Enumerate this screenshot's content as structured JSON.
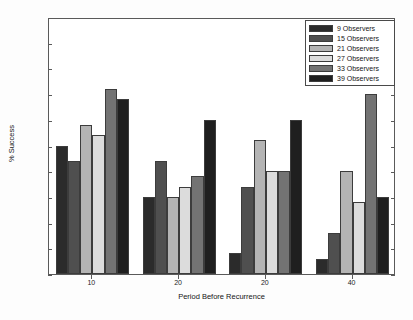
{
  "chart_data": {
    "type": "bar",
    "title": "",
    "xlabel": "Period Before Recurrence",
    "ylabel": "% Success",
    "categories": [
      "10",
      "20",
      "20",
      "40"
    ],
    "xtick_labels": [
      "10",
      "20",
      "20",
      "40"
    ],
    "ytick_labels": [
      "50",
      "55",
      "60",
      "65",
      "70",
      "75",
      "80",
      "85",
      "90",
      "95",
      "100"
    ],
    "ylim": [
      50,
      100
    ],
    "ystep": 5,
    "grid": false,
    "legend_position": "top-right",
    "series": [
      {
        "name": "9 Observers",
        "color": "#2b2b2b",
        "values": [
          75,
          65,
          54,
          53
        ]
      },
      {
        "name": "15 Observers",
        "color": "#4f4f4f",
        "values": [
          72,
          72,
          67,
          58
        ]
      },
      {
        "name": "21 Observers",
        "color": "#b4b4b4",
        "values": [
          79,
          65,
          76,
          70
        ]
      },
      {
        "name": "27 Observers",
        "color": "#dcdcdc",
        "values": [
          77,
          67,
          70,
          64
        ]
      },
      {
        "name": "33 Observers",
        "color": "#737373",
        "values": [
          86,
          69,
          70,
          85
        ]
      },
      {
        "name": "39 Observers",
        "color": "#1f1f1f",
        "values": [
          84,
          80,
          80,
          65
        ]
      }
    ]
  }
}
